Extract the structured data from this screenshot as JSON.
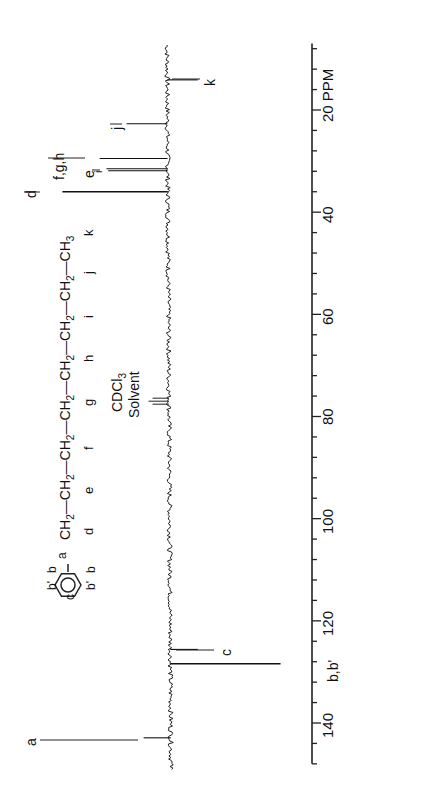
{
  "chart_data": {
    "type": "line",
    "xlabel": "PPM",
    "ylabel": "",
    "xlim": [
      148,
      7
    ],
    "orientation": "rotated-90-ccw",
    "axis_ticks": [
      20,
      40,
      60,
      80,
      100,
      120,
      140
    ],
    "axis_tick_labels": [
      "20 PPM",
      "40",
      "60",
      "80",
      "100",
      "120",
      "140"
    ],
    "minor_tick_step": 4,
    "grid": false,
    "legend": null,
    "peaks": [
      {
        "label": "a",
        "ppm": 142.9,
        "height": 0.16,
        "direction": "up"
      },
      {
        "label": "b,b'",
        "ppm": 128.4,
        "height": 0.72,
        "direction": "down"
      },
      {
        "label": "c",
        "ppm": 125.6,
        "height": 0.18,
        "direction": "down"
      },
      {
        "label": "CDCl3 Solvent",
        "ppm": 77.0,
        "height": 0.12,
        "direction": "up",
        "multiplet": 3
      },
      {
        "label": "d",
        "ppm": 36.0,
        "height": 0.62,
        "direction": "up"
      },
      {
        "label": "e",
        "ppm": 31.9,
        "height": 0.35,
        "direction": "up"
      },
      {
        "label": "i",
        "ppm": 31.5,
        "height": 0.36,
        "direction": "up"
      },
      {
        "label": "f,g,h",
        "ppm": 29.5,
        "height": 0.4,
        "direction": "up"
      },
      {
        "label": "j",
        "ppm": 22.7,
        "height": 0.24,
        "direction": "up"
      },
      {
        "label": "k",
        "ppm": 14.1,
        "height": 0.2,
        "direction": "down"
      }
    ]
  },
  "structure": {
    "ring_labels": {
      "a": "a",
      "b_top": "b",
      "bp_top": "b'",
      "c": "c",
      "b_bot": "b",
      "bp_bot": "b'"
    },
    "chain": [
      {
        "group": "CH",
        "sub": "2",
        "label": "d"
      },
      {
        "group": "CH",
        "sub": "2",
        "label": "e"
      },
      {
        "group": "CH",
        "sub": "2",
        "label": "f"
      },
      {
        "group": "CH",
        "sub": "2",
        "label": "g"
      },
      {
        "group": "CH",
        "sub": "2",
        "label": "h"
      },
      {
        "group": "CH",
        "sub": "2",
        "label": "i"
      },
      {
        "group": "CH",
        "sub": "2",
        "label": "j"
      },
      {
        "group": "CH",
        "sub": "3",
        "label": "k"
      }
    ]
  },
  "solvent": {
    "line1": "CDCl",
    "line1_sub": "3",
    "line2": "Solvent"
  },
  "peak_labels": {
    "a": "a",
    "bb": "b,b'",
    "c": "c",
    "d": "d",
    "e": "e",
    "i": "i",
    "fgh": "f,g,h",
    "j": "j",
    "k": "k"
  },
  "axis": {
    "unit": "PPM"
  }
}
